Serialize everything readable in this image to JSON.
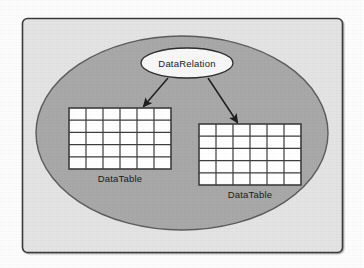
{
  "figure": {
    "type": "concept-diagram",
    "background_color": "#fcfcfc",
    "frame": {
      "fill_color": "#e3e3e3",
      "border_color": "#3a3a3a",
      "x": 22,
      "y": 18,
      "width": 320,
      "height": 234,
      "corner_radius": 5
    },
    "container_ellipse": {
      "name": "DataSet",
      "fill_color": "#a8a8a8",
      "border_color": "#5c5c5c",
      "cx": 182,
      "cy": 133,
      "rx": 146,
      "ry": 97
    },
    "relation_node": {
      "label": "DataRelation",
      "fill_color": "#f7f7f7",
      "border_color": "#2e2e2e",
      "cx": 187,
      "cy": 63,
      "rx": 46,
      "ry": 15
    },
    "tables": [
      {
        "label": "DataTable",
        "columns": 6,
        "rows": 5,
        "x": 69,
        "y": 108,
        "width": 102,
        "height": 61,
        "fill_color": "#ffffff",
        "line_color": "#3d3d3d",
        "label_x": 120,
        "label_y": 182
      },
      {
        "label": "DataTable",
        "columns": 6,
        "rows": 5,
        "x": 199,
        "y": 124,
        "width": 102,
        "height": 61,
        "fill_color": "#ffffff",
        "line_color": "#3d3d3d",
        "label_x": 250,
        "label_y": 198
      }
    ],
    "arrows": [
      {
        "name": "relation-to-left-table",
        "from_x": 168,
        "from_y": 78,
        "to_x": 143,
        "to_y": 107,
        "color": "#1f1f1f"
      },
      {
        "name": "relation-to-right-table",
        "from_x": 208,
        "from_y": 78,
        "to_x": 238,
        "to_y": 123,
        "color": "#1f1f1f"
      }
    ]
  }
}
